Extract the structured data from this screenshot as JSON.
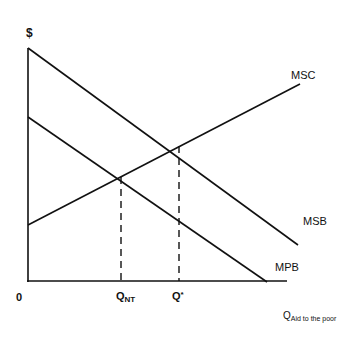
{
  "diagram": {
    "y_axis_label": "$",
    "origin_label": "0",
    "x_axis_label": {
      "main": "Q",
      "subscript": "Aid to the poor"
    },
    "ticks": [
      {
        "id": "q_nt",
        "main": "Q",
        "subscript": "NT"
      },
      {
        "id": "q_star",
        "main": "Q",
        "superscript": "*"
      }
    ],
    "curves": [
      {
        "name": "MSC",
        "label": "MSC"
      },
      {
        "name": "MSB",
        "label": "MSB"
      },
      {
        "name": "MPB",
        "label": "MPB"
      }
    ],
    "colors": {
      "line": "#111111",
      "background": "#ffffff"
    }
  }
}
